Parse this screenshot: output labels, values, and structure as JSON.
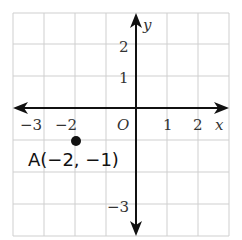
{
  "figure": {
    "type": "coordinate-plane",
    "axes": {
      "x_label": "x",
      "y_label": "y",
      "origin_label": "O",
      "x_tick_labels": [
        "−3",
        "−2",
        "1",
        "2"
      ],
      "y_tick_labels": [
        "2",
        "1",
        "−3"
      ],
      "x_range": [
        -4,
        3
      ],
      "y_range": [
        -4,
        3
      ]
    },
    "point": {
      "name": "A",
      "x": -2,
      "y": -1,
      "label": "A(−2, −1)"
    },
    "colors": {
      "grid": "#cfcfcf",
      "axis": "#111111",
      "point": "#111111"
    }
  }
}
